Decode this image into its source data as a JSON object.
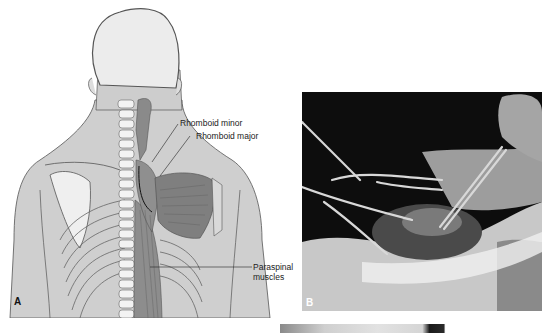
{
  "figure": {
    "panels": [
      {
        "id": "A",
        "type": "anatomical-illustration",
        "subject": "posterior view of back muscles",
        "letter": "A",
        "labels": {
          "rhomboid_minor": "Rhomboid minor",
          "rhomboid_major": "Rhomboid major",
          "paraspinal_line1": "Paraspinal",
          "paraspinal_line2": "muscles"
        }
      },
      {
        "id": "B",
        "type": "surgical-photograph",
        "subject": "retractors and forceps in surgical field",
        "letter": "B"
      },
      {
        "id": "C",
        "type": "surgical-photograph",
        "subject": "partially visible photograph (cropped at bottom edge)"
      }
    ]
  }
}
